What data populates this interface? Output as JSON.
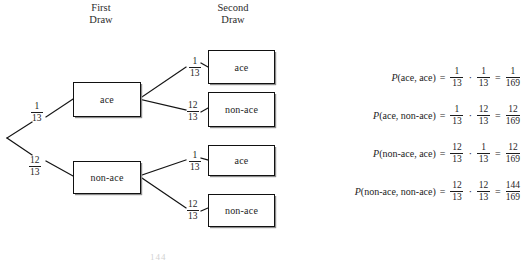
{
  "figure": {
    "type": "probability-tree",
    "headers": {
      "first": "First\nDraw",
      "second": "Second\nDraw"
    },
    "first_draw": [
      {
        "label": "ace",
        "prob_num": "1",
        "prob_den": "13"
      },
      {
        "label": "non-ace",
        "prob_num": "12",
        "prob_den": "13"
      }
    ],
    "second_draw": [
      {
        "label": "ace",
        "prob_num": "1",
        "prob_den": "13"
      },
      {
        "label": "non-ace",
        "prob_num": "12",
        "prob_den": "13"
      },
      {
        "label": "ace",
        "prob_num": "1",
        "prob_den": "13"
      },
      {
        "label": "non-ace",
        "prob_num": "12",
        "prob_den": "13"
      }
    ],
    "equations": [
      {
        "p": "P",
        "args": "(ace, ace)",
        "equals": "=",
        "f1_num": "1",
        "f1_den": "13",
        "dot": "·",
        "f2_num": "1",
        "f2_den": "13",
        "equals2": "=",
        "result_num": "1",
        "result_den": "169"
      },
      {
        "p": "P",
        "args": "(ace, non-ace)",
        "equals": "=",
        "f1_num": "1",
        "f1_den": "13",
        "dot": "·",
        "f2_num": "12",
        "f2_den": "13",
        "equals2": "=",
        "result_num": "12",
        "result_den": "169"
      },
      {
        "p": "P",
        "args": "(non-ace, ace)",
        "equals": "=",
        "f1_num": "12",
        "f1_den": "13",
        "dot": "·",
        "f2_num": "1",
        "f2_den": "13",
        "equals2": "=",
        "result_num": "12",
        "result_den": "169"
      },
      {
        "p": "P",
        "args": "(non-ace, non-ace)",
        "equals": "=",
        "f1_num": "12",
        "f1_den": "13",
        "dot": "·",
        "f2_num": "12",
        "f2_den": "13",
        "equals2": "=",
        "result_num": "144",
        "result_den": "169"
      }
    ],
    "page_artifact": "144",
    "colors": {
      "ink": "#1d1d1d",
      "background": "#ffffff",
      "box_border": "#111111",
      "box_shadow": "#8d8d8d"
    }
  }
}
